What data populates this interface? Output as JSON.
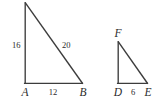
{
  "figure": {
    "background_color": "#ffffff",
    "stroke_color": "#3c3c3c",
    "label_color": "#2b2b2b",
    "triangles": [
      {
        "name": "triangle-ABC",
        "vertices": {
          "apex": {
            "label": "C",
            "shown": false,
            "x": 25,
            "y": 3
          },
          "bottom_left": {
            "label": "A",
            "shown": true,
            "x": 25,
            "y": 83
          },
          "bottom_right": {
            "label": "B",
            "shown": true,
            "x": 82,
            "y": 83
          }
        },
        "side_labels": {
          "vertical_leg": "16",
          "hypotenuse": "20",
          "horizontal_leg": "12"
        }
      },
      {
        "name": "triangle-DEF",
        "vertices": {
          "apex": {
            "label": "F",
            "shown": true,
            "x": 118,
            "y": 42
          },
          "bottom_left": {
            "label": "D",
            "shown": true,
            "x": 118,
            "y": 83
          },
          "bottom_right": {
            "label": "E",
            "shown": true,
            "x": 147,
            "y": 83
          }
        },
        "side_labels": {
          "vertical_leg": "",
          "hypotenuse": "",
          "horizontal_leg": "6"
        }
      }
    ],
    "labels": {
      "left_leg_16": "16",
      "hypotenuse_20": "20",
      "base_12": "12",
      "vertex_A": "A",
      "vertex_B": "B",
      "vertex_D": "D",
      "vertex_E": "E",
      "vertex_F": "F",
      "base_6": "6"
    }
  }
}
